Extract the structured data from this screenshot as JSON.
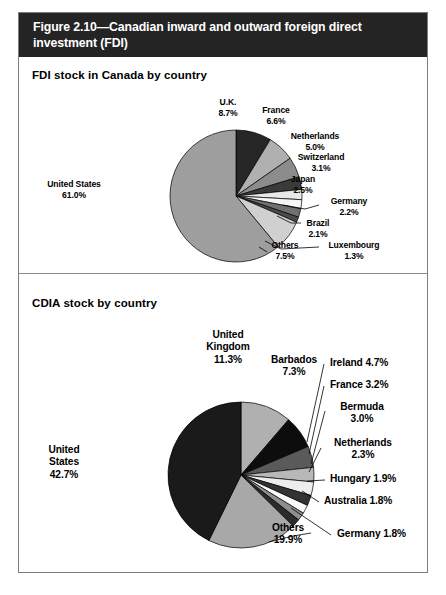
{
  "figure": {
    "title": "Figure 2.10—Canadian inward and outward foreign direct investment (FDI)"
  },
  "panels": [
    {
      "title": "FDI stock in Canada by country"
    },
    {
      "title": "CDIA stock by country"
    }
  ],
  "chart_data": [
    {
      "type": "pie",
      "title": "FDI stock in Canada by country",
      "categories": [
        "United States",
        "U.K.",
        "France",
        "Netherlands",
        "Switzerland",
        "Japan",
        "Germany",
        "Brazil",
        "Luxembourg",
        "Others"
      ],
      "values": [
        61.0,
        8.7,
        6.6,
        5.0,
        3.1,
        2.5,
        2.2,
        2.1,
        1.3,
        7.5
      ],
      "labels": [
        {
          "name": "United States",
          "pct": "61.0%"
        },
        {
          "name": "U.K.",
          "pct": "8.7%"
        },
        {
          "name": "France",
          "pct": "6.6%"
        },
        {
          "name": "Netherlands",
          "pct": "5.0%"
        },
        {
          "name": "Switzerland",
          "pct": "3.1%"
        },
        {
          "name": "Japan",
          "pct": "2.5%"
        },
        {
          "name": "Germany",
          "pct": "2.2%"
        },
        {
          "name": "Brazil",
          "pct": "2.1%"
        },
        {
          "name": "Luxembourg",
          "pct": "1.3%"
        },
        {
          "name": "Others",
          "pct": "7.5%"
        }
      ],
      "slice_colors": [
        "#262626",
        "#b0b0b0",
        "#8c8c8c",
        "#3a3a3a",
        "#e8e8e8",
        "#f5f5f5",
        "#707070",
        "#4a4a4a",
        "#d0d0d0",
        "#9e9e9e"
      ],
      "legend": "none",
      "grid": false
    },
    {
      "type": "pie",
      "title": "CDIA stock by country",
      "categories": [
        "United States",
        "Others",
        "United Kingdom",
        "Barbados",
        "Ireland",
        "France",
        "Bermuda",
        "Netherlands",
        "Hungary",
        "Australia",
        "Germany"
      ],
      "values": [
        42.7,
        19.9,
        11.3,
        7.3,
        4.7,
        3.2,
        3.0,
        2.3,
        1.9,
        1.8,
        1.8
      ],
      "labels": [
        {
          "name": "United States",
          "pct": "42.7%"
        },
        {
          "name": "United Kingdom",
          "pct": "11.3%"
        },
        {
          "name": "Barbados",
          "pct": "7.3%"
        },
        {
          "name": "Ireland",
          "pct": "4.7%"
        },
        {
          "name": "France",
          "pct": "3.2%"
        },
        {
          "name": "Bermuda",
          "pct": "3.0%"
        },
        {
          "name": "Netherlands",
          "pct": "2.3%"
        },
        {
          "name": "Hungary",
          "pct": "1.9%"
        },
        {
          "name": "Australia",
          "pct": "1.8%"
        },
        {
          "name": "Germany",
          "pct": "1.8%"
        },
        {
          "name": "Others",
          "pct": "19.9%"
        }
      ],
      "slice_colors": [
        "#b0b0b0",
        "#0d0d0d",
        "#5a5a5a",
        "#b8b8b8",
        "#ededed",
        "#333333",
        "#fbfbfb",
        "#8f8f8f",
        "#2b2b2b",
        "#a8a8a8",
        "#1a1a1a"
      ],
      "legend": "none",
      "grid": false
    }
  ],
  "chart1_labels": {
    "uk": "U.K.",
    "uk_pct": "8.7%",
    "france": "France",
    "france_pct": "6.6%",
    "netherlands": "Netherlands",
    "netherlands_pct": "5.0%",
    "switzerland": "Switzerland",
    "switzerland_pct": "3.1%",
    "japan": "Japan",
    "japan_pct": "2.5%",
    "germany": "Germany",
    "germany_pct": "2.2%",
    "brazil": "Brazil",
    "brazil_pct": "2.1%",
    "luxembourg": "Luxembourg",
    "luxembourg_pct": "1.3%",
    "others": "Others",
    "others_pct": "7.5%",
    "us": "United States",
    "us_pct": "61.0%"
  },
  "chart2_labels": {
    "uk_line1": "United",
    "uk_line2": "Kingdom",
    "uk_pct": "11.3%",
    "barbados": "Barbados",
    "barbados_pct": "7.3%",
    "ireland": "Ireland 4.7%",
    "france": "France 3.2%",
    "bermuda": "Bermuda",
    "bermuda_pct": "3.0%",
    "netherlands": "Netherlands",
    "netherlands_pct": "2.3%",
    "hungary": "Hungary 1.9%",
    "australia": "Australia 1.8%",
    "germany": "Germany 1.8%",
    "others": "Others",
    "others_pct": "19.9%",
    "us_line1": "United",
    "us_line2": "States",
    "us_pct": "42.7%"
  }
}
